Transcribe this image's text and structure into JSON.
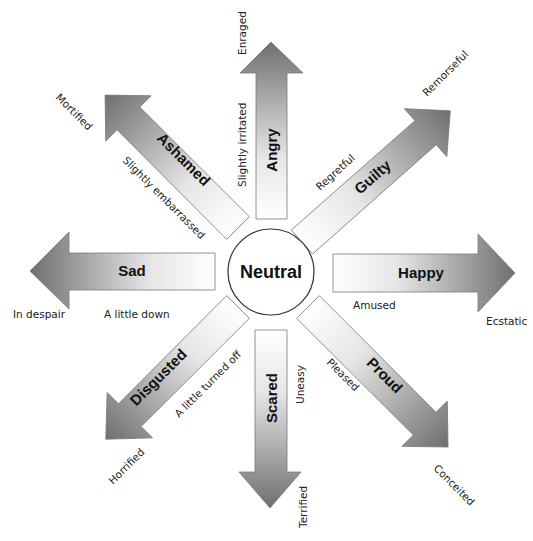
{
  "diagram": {
    "center": {
      "label": "Neutral",
      "cx": 271,
      "cy": 272,
      "r": 43
    },
    "colors": {
      "arrow_start": "#ffffff",
      "arrow_end": "#6f6f6f",
      "stroke": "#7a7a7a",
      "text": "#111111"
    },
    "arrows": [
      {
        "emotion": "Angry",
        "low": "Slightly irritated",
        "high": "Enraged"
      },
      {
        "emotion": "Guilty",
        "low": "Regretful",
        "high": "Remorseful"
      },
      {
        "emotion": "Happy",
        "low": "Amused",
        "high": "Ecstatic"
      },
      {
        "emotion": "Proud",
        "low": "Pleased",
        "high": "Conceited"
      },
      {
        "emotion": "Scared",
        "low": "Uneasy",
        "high": "Terrified"
      },
      {
        "emotion": "Disgusted",
        "low": "A little turned off",
        "high": "Horrified"
      },
      {
        "emotion": "Sad",
        "low": "A little down",
        "high": "In despair"
      },
      {
        "emotion": "Ashamed",
        "low": "Slightly embarrassed",
        "high": "Mortified"
      }
    ]
  }
}
